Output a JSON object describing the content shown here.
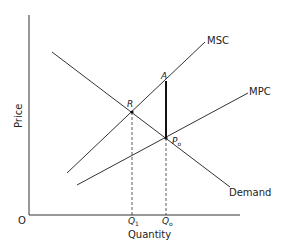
{
  "diagram": {
    "type": "economics-externality",
    "axes": {
      "x_label": "Quantity",
      "y_label": "Price",
      "origin_label": "O"
    },
    "curves": [
      {
        "name": "MSC",
        "label": "MSC",
        "from": [
          67,
          173
        ],
        "to": [
          205,
          42
        ]
      },
      {
        "name": "MPC",
        "label": "MPC",
        "from": [
          77,
          185
        ],
        "to": [
          248,
          93
        ]
      },
      {
        "name": "Demand",
        "label": "Demand",
        "from": [
          52,
          52
        ],
        "to": [
          230,
          187
        ]
      }
    ],
    "points": {
      "R": {
        "label": "R",
        "x": 132,
        "y": 112
      },
      "A": {
        "label": "A",
        "x": 166,
        "y": 81
      },
      "P0": {
        "label": "P",
        "sub": "o",
        "x": 166,
        "y": 138
      }
    },
    "quantities": {
      "Q1": {
        "label": "Q",
        "sub": "1",
        "x": 132
      },
      "Q0": {
        "label": "Q",
        "sub": "o",
        "x": 166
      }
    },
    "colors": {
      "line": "#333333",
      "background": "#ffffff"
    }
  }
}
